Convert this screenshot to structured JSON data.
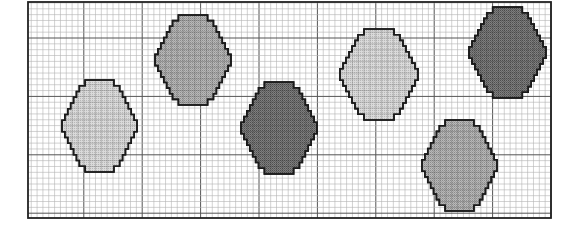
{
  "figure": {
    "frame": {
      "x": 28,
      "y": 2,
      "width": 523,
      "height": 216
    },
    "grid": {
      "cell_size": 5.84,
      "major_every": 10,
      "minor_color": "#b4b4b4",
      "major_color": "#555555",
      "frame_color": "#222222"
    },
    "shade_colors": {
      "light": "#d2d2d2",
      "medium": "#ababab",
      "dark": "#6f6f6f",
      "outline": "#1a1a1a"
    },
    "ovals": [
      {
        "id": "oval-1",
        "shade": "light",
        "x": 62,
        "y": 80,
        "w": 75,
        "h": 92
      },
      {
        "id": "oval-2",
        "shade": "medium",
        "x": 155,
        "y": 15,
        "w": 76,
        "h": 90
      },
      {
        "id": "oval-3",
        "shade": "dark",
        "x": 241,
        "y": 82,
        "w": 76,
        "h": 92
      },
      {
        "id": "oval-4",
        "shade": "light",
        "x": 340,
        "y": 29,
        "w": 78,
        "h": 91
      },
      {
        "id": "oval-5",
        "shade": "dark",
        "x": 469,
        "y": 7,
        "w": 77,
        "h": 91
      },
      {
        "id": "oval-6",
        "shade": "medium",
        "x": 422,
        "y": 120,
        "w": 75,
        "h": 91
      }
    ]
  }
}
